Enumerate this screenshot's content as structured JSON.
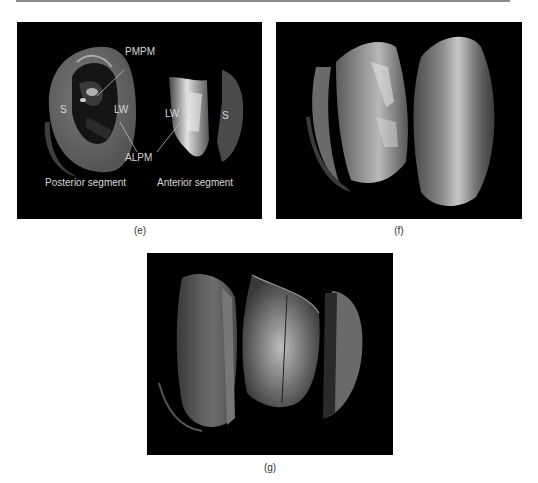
{
  "figure": {
    "panels": [
      {
        "id": "e",
        "caption": "(e)",
        "labels": {
          "pmpm": "PMPM",
          "alpm": "ALPM",
          "s_left": "S",
          "lw_left": "LW",
          "lw_right": "LW",
          "s_right": "S",
          "posterior": "Posterior segment",
          "anterior": "Anterior segment"
        }
      },
      {
        "id": "f",
        "caption": "(f)"
      },
      {
        "id": "g",
        "caption": "(g)"
      }
    ],
    "colors": {
      "background": "#000000",
      "surface": "#6e6e6e",
      "surface_light": "#bdbdbd",
      "surface_dark": "#3a3a3a",
      "label": "#d8d8d8"
    }
  }
}
